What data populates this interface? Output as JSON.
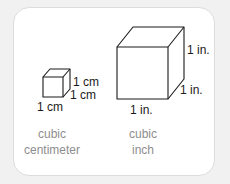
{
  "diagram": {
    "cubes": [
      {
        "name": "cubic centimeter",
        "edge_labels": {
          "height": "1 cm",
          "depth": "1 cm",
          "width": "1 cm"
        },
        "caption_line1": "cubic",
        "caption_line2": "centimeter"
      },
      {
        "name": "cubic inch",
        "edge_labels": {
          "height": "1 in.",
          "depth": "1 in.",
          "width": "1 in."
        },
        "caption_line1": "cubic",
        "caption_line2": "inch"
      }
    ]
  },
  "colors": {
    "background": "#f1f1f1",
    "card": "#ffffff",
    "card_border": "#dcdcdc",
    "stroke": "#1a1a1a",
    "caption": "#8e8e8e"
  }
}
